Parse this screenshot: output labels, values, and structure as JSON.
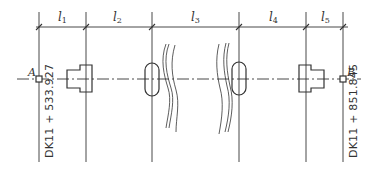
{
  "diagram": {
    "type": "bridge-span-layout-plan",
    "spans": [
      {
        "id": "l1",
        "symbol": "l",
        "sub": "1"
      },
      {
        "id": "l2",
        "symbol": "l",
        "sub": "2"
      },
      {
        "id": "l3",
        "symbol": "l",
        "sub": "3"
      },
      {
        "id": "l4",
        "symbol": "l",
        "sub": "4"
      },
      {
        "id": "l5",
        "symbol": "l",
        "sub": "5"
      }
    ],
    "points": {
      "start": {
        "label": "A",
        "station": "DK11 + 533.927"
      },
      "end": {
        "label": "B",
        "station": "DK11 + 851.845"
      }
    },
    "elements": [
      "left-abutment",
      "pier-1",
      "break-line",
      "break-line",
      "pier-2",
      "right-abutment"
    ],
    "colors": {
      "line": "#333333",
      "background": "#ffffff"
    }
  }
}
